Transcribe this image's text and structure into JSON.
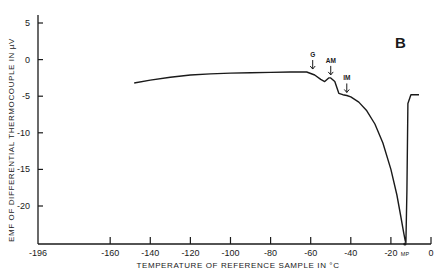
{
  "chart_data": {
    "type": "line",
    "panel_label": "B",
    "title": "",
    "xlabel": "TEMPERATURE OF REFERENCE SAMPLE IN °C",
    "ylabel": "EMF OF DIFFERENTIAL THERMOCOUPLE IN µV",
    "xlim": [
      -196,
      0
    ],
    "ylim": [
      -25,
      5
    ],
    "grid": false,
    "legend": null,
    "x_ticks": [
      {
        "value": -196,
        "label": "-196"
      },
      {
        "value": -160,
        "label": "-160"
      },
      {
        "value": -140,
        "label": "-140"
      },
      {
        "value": -120,
        "label": "-120"
      },
      {
        "value": -100,
        "label": "-100"
      },
      {
        "value": -80,
        "label": "-80"
      },
      {
        "value": -60,
        "label": "-60"
      },
      {
        "value": -40,
        "label": "-40"
      },
      {
        "value": -20,
        "label": "-20"
      },
      {
        "value": 0,
        "label": "0"
      }
    ],
    "y_ticks": [
      {
        "value": 5,
        "label": "5"
      },
      {
        "value": 0,
        "label": "0"
      },
      {
        "value": -5,
        "label": "-5"
      },
      {
        "value": -10,
        "label": "-10"
      },
      {
        "value": -15,
        "label": "-15"
      },
      {
        "value": -20,
        "label": "-20"
      }
    ],
    "series": [
      {
        "name": "DTA curve",
        "x": [
          -148,
          -140,
          -130,
          -120,
          -110,
          -100,
          -90,
          -80,
          -70,
          -62,
          -58,
          -55,
          -53,
          -51,
          -50,
          -48,
          -46,
          -44,
          -42,
          -40,
          -36,
          -32,
          -28,
          -24,
          -20,
          -17,
          -15,
          -13.5,
          -12.8,
          -12.5,
          -12,
          -11.5,
          -10,
          -6
        ],
        "y": [
          -3.2,
          -2.8,
          -2.4,
          -2.1,
          -1.95,
          -1.85,
          -1.8,
          -1.75,
          -1.7,
          -1.7,
          -2.1,
          -2.7,
          -3.0,
          -2.5,
          -2.5,
          -3.0,
          -4.6,
          -4.8,
          -4.9,
          -5.1,
          -5.8,
          -7.0,
          -8.8,
          -11.4,
          -15.0,
          -18.5,
          -21.5,
          -23.8,
          -24.8,
          -25.0,
          -18.0,
          -6.0,
          -4.8,
          -4.8
        ]
      }
    ],
    "annotations": [
      {
        "label": "G",
        "x": -59,
        "y": -1.7,
        "arrow": "down"
      },
      {
        "label": "AM",
        "x": -50,
        "y": -2.5,
        "arrow": "down"
      },
      {
        "label": "IM",
        "x": -42,
        "y": -4.9,
        "arrow": "down"
      },
      {
        "label": "MP",
        "x": -13,
        "y": -25,
        "position": "below-axis"
      }
    ]
  }
}
